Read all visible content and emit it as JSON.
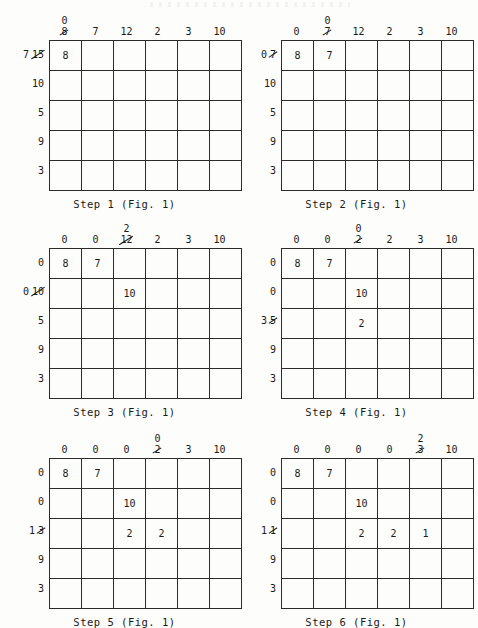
{
  "document": {
    "title": "Hungarian algorithm cost matrix reduction worksheet",
    "figure_ref": "Fig. 1"
  },
  "steps": [
    {
      "id": "step-1",
      "caption": "Step 1 (Fig. 1)",
      "col_headers": [
        {
          "new": "0",
          "old": "8",
          "struck": true
        },
        {
          "new": "",
          "old": "7",
          "struck": false
        },
        {
          "new": "",
          "old": "12",
          "struck": false
        },
        {
          "new": "",
          "old": "2",
          "struck": false
        },
        {
          "new": "",
          "old": "3",
          "struck": false
        },
        {
          "new": "",
          "old": "10",
          "struck": false
        }
      ],
      "row_labels": [
        {
          "new": "7",
          "old": "15",
          "struck": true
        },
        {
          "new": "",
          "old": "10",
          "struck": false
        },
        {
          "new": "",
          "old": "5",
          "struck": false
        },
        {
          "new": "",
          "old": "9",
          "struck": false
        },
        {
          "new": "",
          "old": "3",
          "struck": false
        }
      ],
      "cells": [
        [
          "8",
          "",
          "",
          "",
          "",
          ""
        ],
        [
          "",
          "",
          "",
          "",
          "",
          ""
        ],
        [
          "",
          "",
          "",
          "",
          "",
          ""
        ],
        [
          "",
          "",
          "",
          "",
          "",
          ""
        ],
        [
          "",
          "",
          "",
          "",
          "",
          ""
        ]
      ]
    },
    {
      "id": "step-2",
      "caption": "Step 2 (Fig. 1)",
      "col_headers": [
        {
          "new": "",
          "old": "0",
          "struck": false
        },
        {
          "new": "0",
          "old": "7",
          "struck": true
        },
        {
          "new": "",
          "old": "12",
          "struck": false
        },
        {
          "new": "",
          "old": "2",
          "struck": false
        },
        {
          "new": "",
          "old": "3",
          "struck": false
        },
        {
          "new": "",
          "old": "10",
          "struck": false
        }
      ],
      "row_labels": [
        {
          "new": "0",
          "old": "7",
          "struck": true
        },
        {
          "new": "",
          "old": "10",
          "struck": false
        },
        {
          "new": "",
          "old": "5",
          "struck": false
        },
        {
          "new": "",
          "old": "9",
          "struck": false
        },
        {
          "new": "",
          "old": "3",
          "struck": false
        }
      ],
      "cells": [
        [
          "8",
          "7",
          "",
          "",
          "",
          ""
        ],
        [
          "",
          "",
          "",
          "",
          "",
          ""
        ],
        [
          "",
          "",
          "",
          "",
          "",
          ""
        ],
        [
          "",
          "",
          "",
          "",
          "",
          ""
        ],
        [
          "",
          "",
          "",
          "",
          "",
          ""
        ]
      ]
    },
    {
      "id": "step-3",
      "caption": "Step 3 (Fig. 1)",
      "col_headers": [
        {
          "new": "",
          "old": "0",
          "struck": false
        },
        {
          "new": "",
          "old": "0",
          "struck": false
        },
        {
          "new": "2",
          "old": "12",
          "struck": true
        },
        {
          "new": "",
          "old": "2",
          "struck": false
        },
        {
          "new": "",
          "old": "3",
          "struck": false
        },
        {
          "new": "",
          "old": "10",
          "struck": false
        }
      ],
      "row_labels": [
        {
          "new": "",
          "old": "0",
          "struck": false
        },
        {
          "new": "0",
          "old": "10",
          "struck": true
        },
        {
          "new": "",
          "old": "5",
          "struck": false
        },
        {
          "new": "",
          "old": "9",
          "struck": false
        },
        {
          "new": "",
          "old": "3",
          "struck": false
        }
      ],
      "cells": [
        [
          "8",
          "7",
          "",
          "",
          "",
          ""
        ],
        [
          "",
          "",
          "10",
          "",
          "",
          ""
        ],
        [
          "",
          "",
          "",
          "",
          "",
          ""
        ],
        [
          "",
          "",
          "",
          "",
          "",
          ""
        ],
        [
          "",
          "",
          "",
          "",
          "",
          ""
        ]
      ]
    },
    {
      "id": "step-4",
      "caption": "Step 4 (Fig. 1)",
      "col_headers": [
        {
          "new": "",
          "old": "0",
          "struck": false
        },
        {
          "new": "",
          "old": "0",
          "struck": false
        },
        {
          "new": "0",
          "old": "2",
          "struck": true
        },
        {
          "new": "",
          "old": "2",
          "struck": false
        },
        {
          "new": "",
          "old": "3",
          "struck": false
        },
        {
          "new": "",
          "old": "10",
          "struck": false
        }
      ],
      "row_labels": [
        {
          "new": "",
          "old": "0",
          "struck": false
        },
        {
          "new": "",
          "old": "0",
          "struck": false
        },
        {
          "new": "3",
          "old": "5",
          "struck": true
        },
        {
          "new": "",
          "old": "9",
          "struck": false
        },
        {
          "new": "",
          "old": "3",
          "struck": false
        }
      ],
      "cells": [
        [
          "8",
          "7",
          "",
          "",
          "",
          ""
        ],
        [
          "",
          "",
          "10",
          "",
          "",
          ""
        ],
        [
          "",
          "",
          "2",
          "",
          "",
          ""
        ],
        [
          "",
          "",
          "",
          "",
          "",
          ""
        ],
        [
          "",
          "",
          "",
          "",
          "",
          ""
        ]
      ]
    },
    {
      "id": "step-5",
      "caption": "Step 5 (Fig. 1)",
      "col_headers": [
        {
          "new": "",
          "old": "0",
          "struck": false
        },
        {
          "new": "",
          "old": "0",
          "struck": false
        },
        {
          "new": "",
          "old": "0",
          "struck": false
        },
        {
          "new": "0",
          "old": "2",
          "struck": true
        },
        {
          "new": "",
          "old": "3",
          "struck": false
        },
        {
          "new": "",
          "old": "10",
          "struck": false
        }
      ],
      "row_labels": [
        {
          "new": "",
          "old": "0",
          "struck": false
        },
        {
          "new": "",
          "old": "0",
          "struck": false
        },
        {
          "new": "1",
          "old": "3",
          "struck": true
        },
        {
          "new": "",
          "old": "9",
          "struck": false
        },
        {
          "new": "",
          "old": "3",
          "struck": false
        }
      ],
      "cells": [
        [
          "8",
          "7",
          "",
          "",
          "",
          ""
        ],
        [
          "",
          "",
          "10",
          "",
          "",
          ""
        ],
        [
          "",
          "",
          "2",
          "2",
          "",
          ""
        ],
        [
          "",
          "",
          "",
          "",
          "",
          ""
        ],
        [
          "",
          "",
          "",
          "",
          "",
          ""
        ]
      ]
    },
    {
      "id": "step-6",
      "caption": "Step 6 (Fig. 1)",
      "col_headers": [
        {
          "new": "",
          "old": "0",
          "struck": false
        },
        {
          "new": "",
          "old": "0",
          "struck": false
        },
        {
          "new": "",
          "old": "0",
          "struck": false
        },
        {
          "new": "",
          "old": "0",
          "struck": false
        },
        {
          "new": "2",
          "old": "3",
          "struck": true
        },
        {
          "new": "",
          "old": "10",
          "struck": false
        }
      ],
      "row_labels": [
        {
          "new": "",
          "old": "0",
          "struck": false
        },
        {
          "new": "",
          "old": "0",
          "struck": false
        },
        {
          "new": "1",
          "old": "1",
          "struck": true
        },
        {
          "new": "",
          "old": "9",
          "struck": false
        },
        {
          "new": "",
          "old": "3",
          "struck": false
        }
      ],
      "cells": [
        [
          "8",
          "7",
          "",
          "",
          "",
          ""
        ],
        [
          "",
          "",
          "10",
          "",
          "",
          ""
        ],
        [
          "",
          "",
          "2",
          "2",
          "1",
          ""
        ],
        [
          "",
          "",
          "",
          "",
          "",
          ""
        ],
        [
          "",
          "",
          "",
          "",
          "",
          ""
        ]
      ]
    }
  ],
  "colors": {
    "ink": "#1a1a1a",
    "grid_line": "#2b2b2b",
    "paper": "#fdfdfb"
  }
}
